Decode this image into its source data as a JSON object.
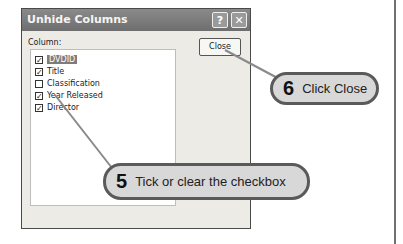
{
  "dialog": {
    "title": "Unhide Columns",
    "help_icon": "?",
    "close_icon": "✕",
    "column_label": "Column:",
    "close_button": "Close",
    "columns": [
      {
        "label": "DVDID",
        "checked": true,
        "selected": true
      },
      {
        "label": "Title",
        "checked": true,
        "selected": false
      },
      {
        "label": "Classification",
        "checked": false,
        "selected": false
      },
      {
        "label": "Year Released",
        "checked": true,
        "selected": false
      },
      {
        "label": "Director",
        "checked": true,
        "selected": false
      }
    ]
  },
  "callouts": [
    {
      "number": "5",
      "text": "Tick or clear the checkbox"
    },
    {
      "number": "6",
      "text": "Click Close"
    }
  ]
}
